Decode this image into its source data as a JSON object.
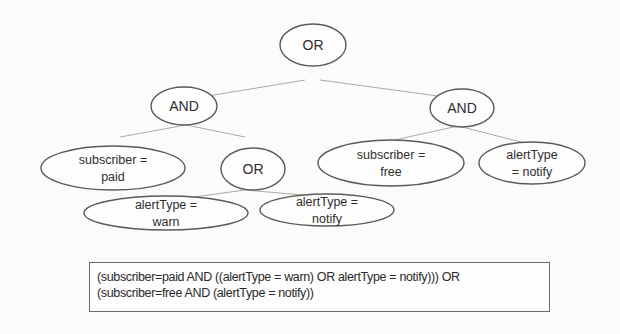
{
  "diagram": {
    "type": "expression-tree",
    "colors": {
      "background": "#fbfbfa",
      "node_stroke": "#5a5a5a",
      "edge": "#a9a9a9",
      "text": "#2e2e2e"
    },
    "nodes": [
      {
        "id": "root-or",
        "lines": [
          "OR"
        ],
        "cx": 313,
        "cy": 45,
        "rx": 33,
        "ry": 21
      },
      {
        "id": "left-and",
        "lines": [
          "AND"
        ],
        "cx": 184,
        "cy": 106,
        "rx": 33,
        "ry": 19
      },
      {
        "id": "right-and",
        "lines": [
          "AND"
        ],
        "cx": 462,
        "cy": 108,
        "rx": 32,
        "ry": 19
      },
      {
        "id": "subscriber-paid",
        "lines": [
          "subscriber =",
          "paid"
        ],
        "cx": 113,
        "cy": 168,
        "rx": 72,
        "ry": 22
      },
      {
        "id": "middle-or",
        "lines": [
          "OR"
        ],
        "cx": 253,
        "cy": 169,
        "rx": 32,
        "ry": 21
      },
      {
        "id": "subscriber-free",
        "lines": [
          "subscriber =",
          "free"
        ],
        "cx": 391,
        "cy": 163,
        "rx": 73,
        "ry": 23
      },
      {
        "id": "alerttype-notify-right",
        "lines": [
          "alertType",
          "= notify"
        ],
        "cx": 532,
        "cy": 163,
        "rx": 53,
        "ry": 21
      },
      {
        "id": "alerttype-warn",
        "lines": [
          "alertType =",
          "warn"
        ],
        "cx": 166,
        "cy": 213,
        "rx": 82,
        "ry": 17
      },
      {
        "id": "alerttype-notify-lower",
        "lines": [
          "alertType =",
          "notify"
        ],
        "cx": 327,
        "cy": 210,
        "rx": 67,
        "ry": 16
      }
    ],
    "edges": [
      {
        "from": "root-or",
        "to": "left-and",
        "x1": 305,
        "y1": 80,
        "x2": 196,
        "y2": 98
      },
      {
        "from": "root-or",
        "to": "right-and",
        "x1": 320,
        "y1": 80,
        "x2": 460,
        "y2": 99
      },
      {
        "from": "left-and",
        "to": "subscriber-paid",
        "x1": 186,
        "y1": 125,
        "x2": 120,
        "y2": 137
      },
      {
        "from": "left-and",
        "to": "middle-or",
        "x1": 186,
        "y1": 125,
        "x2": 245,
        "y2": 137
      },
      {
        "from": "right-and",
        "to": "subscriber-free",
        "x1": 458,
        "y1": 126,
        "x2": 390,
        "y2": 141
      },
      {
        "from": "right-and",
        "to": "alerttype-notify-right",
        "x1": 458,
        "y1": 126,
        "x2": 525,
        "y2": 143
      },
      {
        "from": "middle-or",
        "to": "alerttype-warn",
        "x1": 245,
        "y1": 190,
        "x2": 172,
        "y2": 200
      },
      {
        "from": "middle-or",
        "to": "alerttype-notify-lower",
        "x1": 245,
        "y1": 190,
        "x2": 325,
        "y2": 197
      }
    ]
  },
  "expression": {
    "line1": "(subscriber=paid AND ((alertType = warn) OR alertType = notify))) OR",
    "line2": "(subscriber=free AND (alertType = notify))"
  }
}
